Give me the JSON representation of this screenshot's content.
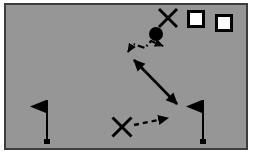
{
  "diagram": {
    "kind": "sports-play-diagram",
    "canvas": {
      "width": 253,
      "height": 167,
      "background": "#ffffff"
    },
    "field": {
      "label": "playing field",
      "x": 4,
      "y": 3,
      "width": 244,
      "height": 147,
      "fill": "#969696",
      "stroke": "#3c3c3c",
      "stroke_width": 2
    },
    "colors": {
      "field": "#969696",
      "field_border": "#3c3c3c",
      "ink": "#000000",
      "marker_fill": "#ffffff",
      "page": "#ffffff"
    },
    "markers": [
      {
        "id": "x-top",
        "name": "x-marker-top",
        "shape": "x-cross",
        "label": "X",
        "cx": 168,
        "cy": 18,
        "size": 18,
        "stroke": "#000000",
        "stroke_width": 3
      },
      {
        "id": "ball",
        "name": "ball-marker",
        "shape": "filled-circle",
        "label": "ball",
        "cx": 156,
        "cy": 34,
        "r": 7,
        "fill": "#000000"
      },
      {
        "id": "square-1",
        "name": "square-marker-1",
        "shape": "outlined-square",
        "label": "",
        "x": 187,
        "y": 10,
        "size": 18,
        "fill": "#ffffff",
        "stroke": "#000000",
        "stroke_width": 3
      },
      {
        "id": "square-2",
        "name": "square-marker-2",
        "shape": "outlined-square",
        "label": "",
        "x": 215,
        "y": 14,
        "size": 18,
        "fill": "#ffffff",
        "stroke": "#000000",
        "stroke_width": 3
      },
      {
        "id": "x-bottom",
        "name": "x-marker-bottom",
        "shape": "x-cross",
        "label": "X",
        "cx": 122,
        "cy": 127,
        "size": 19,
        "stroke": "#000000",
        "stroke_width": 3
      }
    ],
    "flags": [
      {
        "id": "flag-left",
        "name": "flag-left",
        "label": "left flag",
        "pole_x": 47,
        "pole_top": 100,
        "pole_bottom": 143,
        "pennant_direction": "left",
        "pennant_width": 16,
        "pennant_height": 13,
        "color": "#000000"
      },
      {
        "id": "flag-right",
        "name": "flag-right",
        "label": "right flag",
        "pole_x": 203,
        "pole_top": 100,
        "pole_bottom": 143,
        "pennant_direction": "left",
        "pennant_width": 16,
        "pennant_height": 13,
        "color": "#000000"
      }
    ],
    "paths": [
      {
        "id": "path-dashdot",
        "name": "dash-dot-path",
        "style": "dash-dot",
        "label": "dash-dot motion path",
        "points": "128,52 133,44 145,48 151,41 163,46",
        "arrowheads": [
          "start",
          "end"
        ],
        "stroke": "#000000",
        "stroke_width": 2.2,
        "dasharray": "7,3,1.5,3"
      },
      {
        "id": "path-solid",
        "name": "solid-double-arrow-path",
        "style": "solid",
        "label": "solid two-way path",
        "points": "134,60 177,104",
        "arrowheads": [
          "start",
          "end"
        ],
        "stroke": "#000000",
        "stroke_width": 2.6,
        "dasharray": "none"
      },
      {
        "id": "path-dashed",
        "name": "dashed-path",
        "style": "dashed",
        "label": "dashed motion path",
        "points": "134,125 168,118",
        "arrowheads": [
          "end"
        ],
        "stroke": "#000000",
        "stroke_width": 2.4,
        "dasharray": "5,4"
      }
    ],
    "legend_note": ""
  }
}
